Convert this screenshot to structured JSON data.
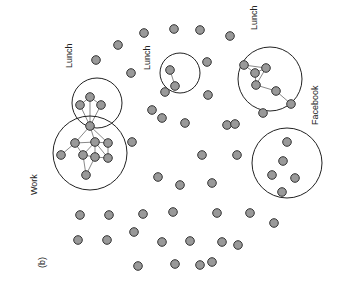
{
  "figure": {
    "panel_label": "(b)",
    "clusters": [
      {
        "id": "lunch-left",
        "label": "Lunch",
        "cx": 97,
        "cy": 103,
        "r": 25,
        "label_x": 72,
        "label_y": 68
      },
      {
        "id": "work",
        "label": "Work",
        "cx": 90,
        "cy": 153,
        "r": 37,
        "label_x": 37,
        "label_y": 195
      },
      {
        "id": "lunch-mid",
        "label": "Lunch",
        "cx": 180,
        "cy": 73,
        "r": 20,
        "label_x": 150,
        "label_y": 70
      },
      {
        "id": "lunch-right",
        "label": "Lunch",
        "cx": 270,
        "cy": 79,
        "r": 32,
        "label_x": 257,
        "label_y": 30
      },
      {
        "id": "facebook",
        "label": "Facebook",
        "cx": 287,
        "cy": 163,
        "r": 35,
        "label_x": 318,
        "label_y": 125
      }
    ],
    "nodes": [
      [
        144,
        33
      ],
      [
        118,
        45
      ],
      [
        96,
        60
      ],
      [
        131,
        73
      ],
      [
        152,
        110
      ],
      [
        165,
        92
      ],
      [
        208,
        95
      ],
      [
        170,
        70
      ],
      [
        175,
        86
      ],
      [
        174,
        29
      ],
      [
        200,
        30
      ],
      [
        230,
        36
      ],
      [
        207,
        62
      ],
      [
        90,
        97
      ],
      [
        80,
        105
      ],
      [
        101,
        105
      ],
      [
        90,
        126
      ],
      [
        75,
        143
      ],
      [
        95,
        142
      ],
      [
        108,
        143
      ],
      [
        83,
        155
      ],
      [
        95,
        157
      ],
      [
        61,
        155
      ],
      [
        108,
        158
      ],
      [
        86,
        175
      ],
      [
        244,
        65
      ],
      [
        255,
        73
      ],
      [
        266,
        68
      ],
      [
        256,
        85
      ],
      [
        276,
        91
      ],
      [
        291,
        104
      ],
      [
        263,
        113
      ],
      [
        227,
        125
      ],
      [
        287,
        142
      ],
      [
        283,
        161
      ],
      [
        272,
        175
      ],
      [
        295,
        178
      ],
      [
        282,
        192
      ],
      [
        202,
        155
      ],
      [
        237,
        155
      ],
      [
        212,
        183
      ],
      [
        180,
        185
      ],
      [
        158,
        177
      ],
      [
        132,
        142
      ],
      [
        185,
        123
      ],
      [
        162,
        118
      ],
      [
        235,
        124
      ],
      [
        143,
        214
      ],
      [
        173,
        212
      ],
      [
        217,
        213
      ],
      [
        250,
        213
      ],
      [
        274,
        223
      ],
      [
        80,
        215
      ],
      [
        109,
        215
      ],
      [
        134,
        232
      ],
      [
        78,
        240
      ],
      [
        107,
        240
      ],
      [
        162,
        242
      ],
      [
        222,
        242
      ],
      [
        190,
        241
      ],
      [
        200,
        265
      ],
      [
        238,
        245
      ],
      [
        175,
        264
      ],
      [
        212,
        262
      ],
      [
        138,
        266
      ]
    ],
    "edges": [
      [
        13,
        14
      ],
      [
        13,
        15
      ],
      [
        13,
        16
      ],
      [
        14,
        16
      ],
      [
        15,
        16
      ],
      [
        16,
        17
      ],
      [
        16,
        18
      ],
      [
        16,
        19
      ],
      [
        17,
        18
      ],
      [
        18,
        19
      ],
      [
        17,
        22
      ],
      [
        18,
        20
      ],
      [
        18,
        21
      ],
      [
        19,
        23
      ],
      [
        20,
        21
      ],
      [
        21,
        23
      ],
      [
        20,
        24
      ],
      [
        21,
        24
      ],
      [
        17,
        20
      ],
      [
        18,
        23
      ],
      [
        7,
        8
      ],
      [
        25,
        26
      ],
      [
        25,
        27
      ],
      [
        26,
        27
      ],
      [
        26,
        28
      ],
      [
        27,
        28
      ],
      [
        28,
        29
      ],
      [
        29,
        30
      ]
    ]
  }
}
